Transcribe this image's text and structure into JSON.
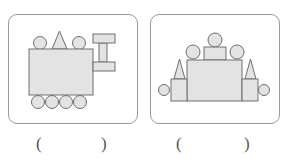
{
  "panels": [
    {
      "name": "bulldozer-figure",
      "shapes": "circles, triangle, rectangles forming a vehicle with rollers and a blade"
    },
    {
      "name": "castle-figure",
      "shapes": "rectangles, triangles and circles arranged symmetrically"
    }
  ],
  "answers": [
    {
      "open": "(",
      "close": ")"
    },
    {
      "open": "(",
      "close": ")"
    }
  ],
  "colors": {
    "fill": "#e3e3e3",
    "stroke": "#6e6e6e",
    "border": "#9a9a9a"
  }
}
